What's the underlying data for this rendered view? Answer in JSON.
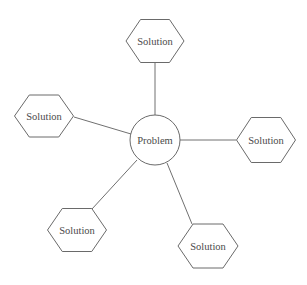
{
  "diagram": {
    "type": "hub-and-spoke",
    "center": {
      "label": "Problem",
      "shape": "circle",
      "cx": 155,
      "cy": 140,
      "r": 25
    },
    "nodes": [
      {
        "id": "top",
        "label": "Solution",
        "shape": "hexagon",
        "cx": 155,
        "cy": 41,
        "w": 58,
        "h": 43,
        "edge": {
          "x1": 155,
          "y1": 63,
          "x2": 155,
          "y2": 115
        }
      },
      {
        "id": "left",
        "label": "Solution",
        "shape": "hexagon",
        "cx": 44,
        "cy": 116,
        "w": 59,
        "h": 42,
        "edge": {
          "x1": 74,
          "y1": 117,
          "x2": 131,
          "y2": 134
        }
      },
      {
        "id": "right",
        "label": "Solution",
        "shape": "hexagon",
        "cx": 266,
        "cy": 140,
        "w": 59,
        "h": 45,
        "edge": {
          "x1": 180,
          "y1": 140,
          "x2": 236,
          "y2": 140
        }
      },
      {
        "id": "bottom-left",
        "label": "Solution",
        "shape": "hexagon",
        "cx": 77,
        "cy": 230,
        "w": 59,
        "h": 43,
        "edge": {
          "x1": 137,
          "y1": 160,
          "x2": 92,
          "y2": 209
        }
      },
      {
        "id": "bottom-right",
        "label": "Solution",
        "shape": "hexagon",
        "cx": 208,
        "cy": 246,
        "w": 60,
        "h": 44,
        "edge": {
          "x1": 167,
          "y1": 163,
          "x2": 192,
          "y2": 224
        }
      }
    ],
    "colors": {
      "line": "#707070",
      "shape_stroke": "#6a6a6a",
      "text": "#4a4a4a",
      "background": "#ffffff"
    }
  }
}
